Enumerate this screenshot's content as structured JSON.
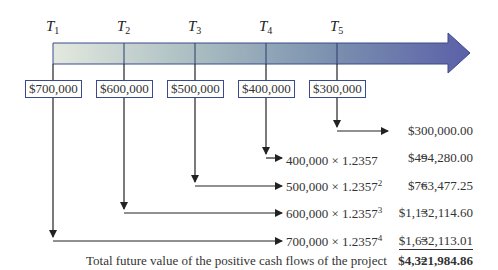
{
  "timeline": {
    "periods": [
      {
        "label": "T",
        "sub": "1",
        "cash_flow": "$700,000"
      },
      {
        "label": "T",
        "sub": "2",
        "cash_flow": "$600,000"
      },
      {
        "label": "T",
        "sub": "3",
        "cash_flow": "$500,000"
      },
      {
        "label": "T",
        "sub": "4",
        "cash_flow": "$400,000"
      },
      {
        "label": "T",
        "sub": "5",
        "cash_flow": "$300,000"
      }
    ],
    "colors": {
      "arrow_start": "#dfe6dd",
      "arrow_mid": "#8ea6b8",
      "arrow_end": "#5a5fa6",
      "border": "#3a4a8a"
    }
  },
  "calculations": [
    {
      "expr": "",
      "exp": "",
      "eq": "",
      "value": "$300,000.00"
    },
    {
      "expr": "400,000 × 1.2357",
      "exp": "",
      "eq": "=",
      "value": "$494,280.00"
    },
    {
      "expr": "500,000 × 1.2357",
      "exp": "2",
      "eq": "=",
      "value": "$763,477.25"
    },
    {
      "expr": "600,000 × 1.2357",
      "exp": "3",
      "eq": "=",
      "value": "$1,132,114.60"
    },
    {
      "expr": "700,000 × 1.2357",
      "exp": "4",
      "eq": "=",
      "value": "$1,632,113.01"
    }
  ],
  "total": {
    "label": "Total future value of the positive cash flows of the project",
    "eq": "=",
    "value": "$4,321,984.86"
  }
}
